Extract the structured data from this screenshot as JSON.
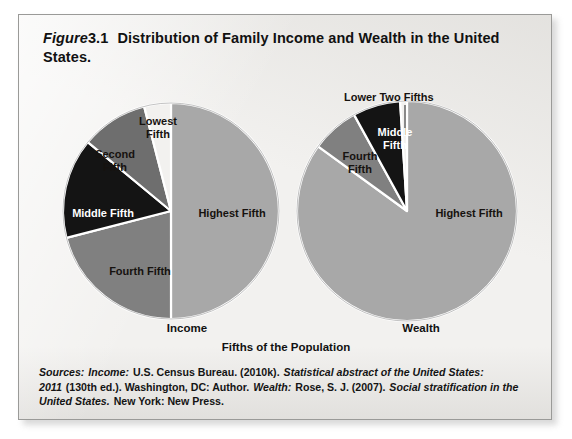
{
  "figure": {
    "label_word": "Figure",
    "number": "3.1",
    "title": "Distribution of Family Income and Wealth in the United States.",
    "axis_caption": "Fifths of the Population"
  },
  "source_note": {
    "lead": "Sources:",
    "income_label": "Income:",
    "income_text_1": "U.S. Census Bureau. (2010k).",
    "income_italic_1": "Statistical abstract of the United States: 2011",
    "income_text_2": "(130th ed.). Washington, DC: Author.",
    "wealth_label": "Wealth:",
    "wealth_text_1": "Rose, S. J. (2007).",
    "wealth_italic_1": "Social stratification in the United States.",
    "wealth_text_2": "New York: New Press.",
    "full_text": "Sources: Income: U.S. Census Bureau. (2010k). Statistical abstract of the United States: 2011 (130th ed.). Washington, DC: Author. Wealth: Rose, S. J. (2007). Social stratification in the United States. New York: New Press."
  },
  "colors": {
    "highest": "#a8a8a8",
    "fourth": "#808080",
    "middle": "#141414",
    "second": "#6e6e6e",
    "lowest": "#f2f1ef",
    "separator": "#ffffff",
    "card_bg": "#f2f1ef",
    "card_border": "#9a9a98",
    "text": "#111111"
  },
  "callouts": {
    "lower_two_fifths": "Lower Two Fifths"
  },
  "chart_data": [
    {
      "type": "pie",
      "title": "Income",
      "caption": "Fifths of the Population",
      "start_angle_deg": 0,
      "direction": "clockwise",
      "categories": [
        "Highest Fifth",
        "Fourth Fifth",
        "Middle Fifth",
        "Second Fifth",
        "Lowest Fifth"
      ],
      "values": [
        50,
        21,
        15,
        10,
        4
      ],
      "unit": "percent",
      "slice_colors": [
        "#a8a8a8",
        "#808080",
        "#141414",
        "#6e6e6e",
        "#f2f1ef"
      ],
      "labels": [
        {
          "text": "Highest Fifth",
          "on_dark": false
        },
        {
          "text": "Fourth Fifth",
          "on_dark": false
        },
        {
          "text": "Middle Fifth",
          "on_dark": true
        },
        {
          "text": "Second\nFifth",
          "on_dark": false
        },
        {
          "text": "Lowest\nFifth",
          "on_dark": false
        }
      ]
    },
    {
      "type": "pie",
      "title": "Wealth",
      "caption": "Fifths of the Population",
      "start_angle_deg": 0,
      "direction": "clockwise",
      "categories": [
        "Highest Fifth",
        "Fourth Fifth",
        "Middle Fifth",
        "Lower Two Fifths"
      ],
      "values": [
        85,
        7,
        7,
        1
      ],
      "unit": "percent",
      "slice_colors": [
        "#a8a8a8",
        "#808080",
        "#141414",
        "#f2f1ef"
      ],
      "labels": [
        {
          "text": "Highest Fifth",
          "on_dark": false
        },
        {
          "text": "Fourth\nFifth",
          "on_dark": false
        },
        {
          "text": "Middle\nFifth",
          "on_dark": true
        },
        {
          "text": "Lower Two Fifths",
          "on_dark": false
        }
      ]
    }
  ]
}
